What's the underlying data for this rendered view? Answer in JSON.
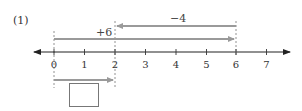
{
  "problem_label": "(1)",
  "number_line": {
    "ticks": [
      "0",
      "1",
      "2",
      "3",
      "4",
      "5",
      "6",
      "7"
    ],
    "tick_x": [
      54,
      84.5,
      115,
      145.5,
      176,
      206.5,
      236,
      266.5
    ],
    "axis_color": "#333333"
  },
  "arrows": {
    "plus": {
      "label": "+6",
      "from": "0",
      "to": "6"
    },
    "minus": {
      "label": "−4",
      "from": "6",
      "to": "2"
    },
    "result": {
      "label": "",
      "from": "0",
      "to": "2"
    },
    "color": "#9a9a9a"
  },
  "answer_box": {
    "value": ""
  }
}
